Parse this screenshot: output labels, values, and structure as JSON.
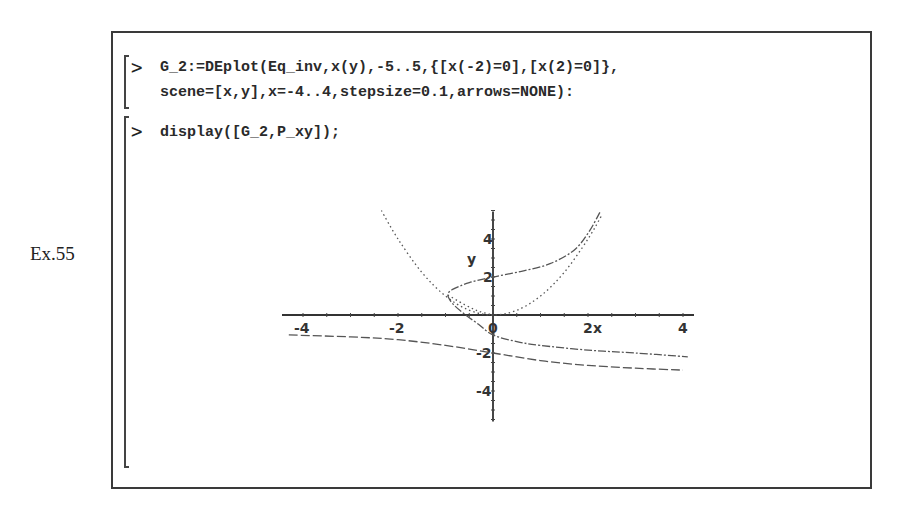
{
  "example_label": "Ex.55",
  "worksheet": {
    "prompt_symbol": ">",
    "inputs": [
      {
        "lines": [
          "G_2:=DEplot(Eq_inv,x(y),-5..5,{[x(-2)=0],[x(2)=0]},",
          "scene=[x,y],x=-4..4,stepsize=0.1,arrows=NONE):"
        ]
      },
      {
        "lines": [
          "display([G_2,P_xy]);"
        ]
      }
    ]
  },
  "chart_data": {
    "type": "line",
    "title": "",
    "xlabel": "x",
    "ylabel": "y",
    "xlim": [
      -4.4,
      4.4
    ],
    "ylim": [
      -5.5,
      5.5
    ],
    "x_ticks": [
      "-4",
      "-2",
      "0",
      "2",
      "4"
    ],
    "y_ticks": [
      "4",
      "2",
      "-2",
      "-4"
    ],
    "grid": false,
    "legend": null,
    "series": [
      {
        "name": "P_xy (y = x^2)",
        "style": "dotted",
        "points": [
          [
            -2.35,
            5.5
          ],
          [
            -2.0,
            4.0
          ],
          [
            -1.5,
            2.25
          ],
          [
            -1.0,
            1.0
          ],
          [
            -0.5,
            0.25
          ],
          [
            0,
            0
          ],
          [
            0.5,
            0.25
          ],
          [
            1.0,
            1.0
          ],
          [
            1.5,
            2.25
          ],
          [
            2.0,
            4.0
          ],
          [
            2.3,
            5.3
          ]
        ]
      },
      {
        "name": "G_2 solution through x(2)=0",
        "style": "dash-dot",
        "points": [
          [
            2.25,
            5.4
          ],
          [
            2.0,
            4.3
          ],
          [
            1.7,
            3.4
          ],
          [
            1.2,
            2.7
          ],
          [
            0.6,
            2.3
          ],
          [
            0,
            2.0
          ],
          [
            -0.5,
            1.7
          ],
          [
            -0.85,
            1.35
          ],
          [
            -0.95,
            1.05
          ],
          [
            -0.85,
            0.6
          ],
          [
            -0.6,
            0.05
          ],
          [
            -0.3,
            -0.5
          ],
          [
            0,
            -1.05
          ],
          [
            0.5,
            -1.4
          ],
          [
            1.0,
            -1.6
          ],
          [
            2.0,
            -1.85
          ],
          [
            3.0,
            -2.0
          ],
          [
            4.1,
            -2.2
          ]
        ]
      },
      {
        "name": "G_2 solution through x(-2)=0",
        "style": "dashed",
        "points": [
          [
            -4.3,
            -1.05
          ],
          [
            -3.0,
            -1.15
          ],
          [
            -2.0,
            -1.3
          ],
          [
            -1.0,
            -1.6
          ],
          [
            0,
            -2.0
          ],
          [
            1.0,
            -2.4
          ],
          [
            2.0,
            -2.65
          ],
          [
            3.0,
            -2.8
          ],
          [
            4.0,
            -2.9
          ]
        ]
      },
      {
        "name": "G_2 secondary branch near origin",
        "style": "dotted",
        "points": [
          [
            -0.95,
            1.05
          ],
          [
            -0.6,
            0.55
          ],
          [
            -0.3,
            0.2
          ],
          [
            0,
            0.0
          ]
        ]
      }
    ]
  }
}
